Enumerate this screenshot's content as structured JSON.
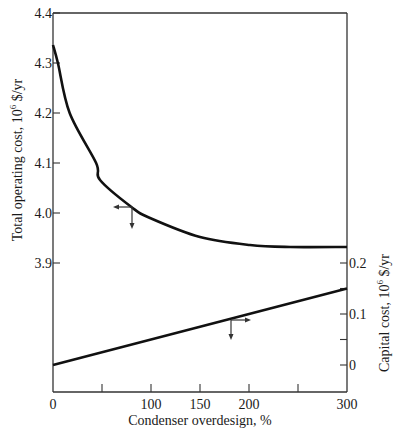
{
  "chart_data": {
    "type": "line",
    "title": "",
    "xlabel": "Condenser overdesign, %",
    "ylabel_left": "Total operating cost, 10^6 $/yr",
    "ylabel_left_parts": {
      "pre": "Total operating cost, 10",
      "sup": "6",
      "post": " $/yr"
    },
    "ylabel_right": "Capital cost, 10^6 $/yr",
    "ylabel_right_parts": {
      "pre": "Capital cost, 10",
      "sup": "6",
      "post": " $/yr"
    },
    "xlim": [
      0,
      300
    ],
    "ylim_left": [
      3.9,
      4.4
    ],
    "ylim_right": [
      0,
      0.2
    ],
    "x_ticks": [
      0,
      50,
      100,
      150,
      200,
      250,
      300
    ],
    "x_tick_labels": [
      "0",
      "",
      "100",
      "150",
      "200",
      "",
      "300"
    ],
    "y_left_ticks": [
      4.4,
      4.3,
      4.2,
      4.1,
      4.0,
      3.9
    ],
    "y_left_tick_labels": [
      "4.4",
      "4.3",
      "4.2",
      "4.1",
      "4.0",
      "3.9"
    ],
    "y_right_ticks": [
      0.2,
      0.15,
      0.1,
      0.05,
      0
    ],
    "y_right_tick_labels": [
      "0.2",
      "",
      "0.1",
      "",
      "0"
    ],
    "grid": false,
    "legend": null,
    "series": [
      {
        "name": "Total operating cost",
        "axis": "left",
        "x": [
          0,
          5,
          17,
          44,
          48,
          80,
          99,
          150,
          201,
          242,
          300
        ],
        "values": [
          4.336,
          4.3,
          4.2,
          4.1,
          4.066,
          4.012,
          3.99,
          3.952,
          3.936,
          3.932,
          3.932
        ]
      },
      {
        "name": "Capital cost",
        "axis": "right",
        "x": [
          0,
          300
        ],
        "values": [
          0.0,
          0.15
        ]
      }
    ],
    "annotations": [
      {
        "type": "axis-indicator-arrow",
        "series": "Total operating cost",
        "direction": "left",
        "at_x": 80
      },
      {
        "type": "axis-indicator-arrow",
        "series": "Capital cost",
        "direction": "right",
        "at_x": 180
      }
    ]
  }
}
